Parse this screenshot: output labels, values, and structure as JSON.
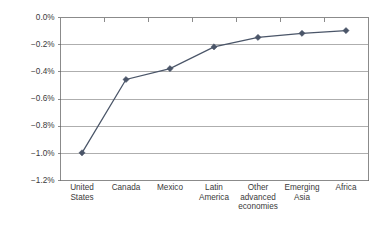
{
  "chart_data": {
    "type": "line",
    "title": "",
    "subtitle": "",
    "xlabel": "",
    "ylabel": "",
    "categories": [
      "United States",
      "Canada",
      "Mexico",
      "Latin America",
      "Other advanced economies",
      "Emerging Asia",
      "Africa"
    ],
    "category_lines": [
      [
        "United",
        "States"
      ],
      [
        "Canada"
      ],
      [
        "Mexico"
      ],
      [
        "Latin",
        "America"
      ],
      [
        "Other",
        "advanced",
        "economies"
      ],
      [
        "Emerging",
        "Asia"
      ],
      [
        "Africa"
      ]
    ],
    "values": [
      -1.0,
      -0.46,
      -0.38,
      -0.22,
      -0.15,
      -0.12,
      -0.1
    ],
    "value_labels": [
      "-1.00%",
      "-0.46%",
      "-0.38%",
      "-0.22%",
      "-0.15%",
      "-0.12%",
      "-0.10%"
    ],
    "ylim": [
      -1.2,
      0.0
    ],
    "ytick_values": [
      0.0,
      -0.2,
      -0.4,
      -0.6,
      -0.8,
      -1.0,
      -1.2
    ],
    "ytick_labels": [
      "0.0%",
      "-0.2%",
      "-0.4%",
      "-0.6%",
      "-0.8%",
      "-1.0%",
      "-1.2%"
    ],
    "grid": true,
    "grid_axis": "y",
    "legend": false,
    "legend_position": "none",
    "series": [
      {
        "name": "",
        "values": [
          -1.0,
          -0.46,
          -0.38,
          -0.22,
          -0.15,
          -0.12,
          -0.1
        ],
        "color": "#4a5568",
        "marker": "diamond"
      }
    ],
    "colors": {
      "series": "#4a5568",
      "gridline": "#8c8c8c",
      "frame": "#6e6e6e",
      "text": "#3a3a3a",
      "background": "#ffffff"
    }
  },
  "layout": {
    "plot_left": 60,
    "plot_right": 368,
    "plot_top": 17,
    "plot_bottom": 180
  }
}
